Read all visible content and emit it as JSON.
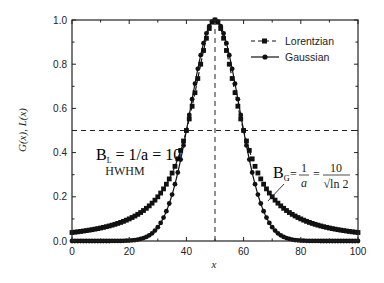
{
  "chart_data": {
    "type": "line",
    "title": "",
    "xlabel": "x",
    "ylabel": "G(x), L(x)",
    "xlim": [
      0,
      100
    ],
    "ylim": [
      0.0,
      1.0
    ],
    "xticks": [
      0,
      20,
      40,
      60,
      80,
      100
    ],
    "yticks": [
      0.0,
      0.2,
      0.4,
      0.6,
      0.8,
      1.0
    ],
    "xtick_labels": [
      "0",
      "20",
      "40",
      "60",
      "80",
      "100"
    ],
    "ytick_labels": [
      "0.0",
      "0.2",
      "0.4",
      "0.6",
      "0.8",
      "1.0"
    ],
    "grid": false,
    "legend_position": "upper right",
    "center": 50,
    "hwhm": 10,
    "series": [
      {
        "name": "Lorentzian",
        "style": "dashed line with square markers",
        "formula": "1/(1+((x-50)/10)^2)",
        "x": [
          0,
          10,
          20,
          30,
          35,
          40,
          45,
          50,
          55,
          60,
          65,
          70,
          80,
          90,
          100
        ],
        "values": [
          0.038,
          0.059,
          0.1,
          0.2,
          0.308,
          0.5,
          0.8,
          1.0,
          0.8,
          0.5,
          0.308,
          0.2,
          0.1,
          0.059,
          0.038
        ]
      },
      {
        "name": "Gaussian",
        "style": "solid line with circle markers",
        "formula": "exp(-ln2*((x-50)/10)^2)",
        "x": [
          0,
          10,
          20,
          25,
          30,
          35,
          40,
          45,
          50,
          55,
          60,
          65,
          70,
          75,
          80,
          90,
          100
        ],
        "values": [
          0.0,
          0.0,
          0.002,
          0.013,
          0.063,
          0.21,
          0.5,
          0.841,
          1.0,
          0.841,
          0.5,
          0.21,
          0.063,
          0.013,
          0.002,
          0.0,
          0.0
        ]
      }
    ],
    "reference_lines": [
      {
        "type": "horizontal",
        "y": 0.5,
        "style": "dashed"
      },
      {
        "type": "vertical",
        "x": 50,
        "style": "dashed"
      }
    ],
    "annotations": [
      {
        "text_line1": "B_L = 1/a = 10",
        "text_line2": "HWHM",
        "x": 25,
        "y": 0.4
      },
      {
        "text": "B_G = 1/a = 10/√ln2",
        "x": 86,
        "y": 0.28,
        "arrow_to": [
          68,
          0.18
        ]
      }
    ]
  },
  "labels": {
    "ylabel": "G(x), L(x)",
    "xlabel": "x",
    "legend_lorentzian": "Lorentzian",
    "legend_gaussian": "Gaussian",
    "annot_bl_main": "B",
    "annot_bl_sub": "L",
    "annot_bl_rest": " = 1/a = 10",
    "annot_hwhm": "HWHM",
    "annot_bg_main": "B",
    "annot_bg_sub": "G",
    "annot_bg_eq": "=",
    "annot_bg_num1": "1",
    "annot_bg_den1": "a",
    "annot_bg_num2": "10",
    "annot_bg_den2": "√ln 2"
  }
}
